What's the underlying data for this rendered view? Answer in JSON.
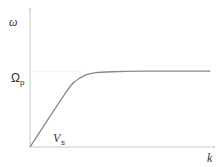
{
  "chart_data": {
    "type": "line",
    "title": "",
    "xlabel": "k",
    "ylabel": "ω",
    "annotations": [
      {
        "text": "Ω",
        "subscript": "p",
        "meaning": "plateau frequency level"
      },
      {
        "text": "V",
        "subscript": "s",
        "meaning": "initial slope (sound velocity)"
      }
    ],
    "xlim": [
      0,
      1
    ],
    "ylim": [
      0,
      1
    ],
    "grid": false,
    "series": [
      {
        "name": "dispersion",
        "x": [
          0,
          0.2,
          0.25,
          0.3,
          0.35,
          0.45,
          0.6,
          0.8,
          0.98
        ],
        "y": [
          0,
          0.49,
          0.58,
          0.63,
          0.65,
          0.66,
          0.665,
          0.665,
          0.665
        ]
      }
    ],
    "reference_lines": [
      {
        "orientation": "horizontal",
        "y": 0.66,
        "style": "dotted",
        "label": "Ω_p"
      }
    ]
  },
  "labels": {
    "y_axis": "ω",
    "x_axis": "k",
    "omega_p_main": "Ω",
    "omega_p_sub": "p",
    "vs_main": "V",
    "vs_sub": "s"
  }
}
